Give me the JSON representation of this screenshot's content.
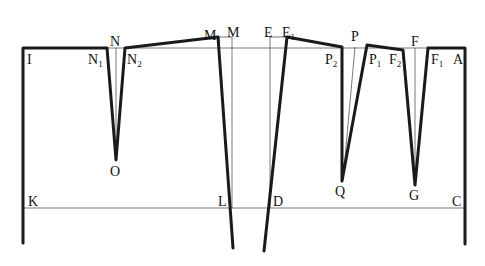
{
  "diagram": {
    "type": "pattern-draft",
    "labels": [
      {
        "id": "I",
        "text": "I",
        "x": 27,
        "y": 64
      },
      {
        "id": "N1",
        "text": "N",
        "sub": "1",
        "x": 90,
        "y": 64
      },
      {
        "id": "N",
        "text": "N",
        "x": 110,
        "y": 46
      },
      {
        "id": "N2",
        "text": "N",
        "sub": "2",
        "x": 128,
        "y": 64
      },
      {
        "id": "O",
        "text": "O",
        "x": 111,
        "y": 176
      },
      {
        "id": "M1",
        "text": "M",
        "sub": "1",
        "x": 204,
        "y": 40
      },
      {
        "id": "M",
        "text": "M",
        "x": 228,
        "y": 40
      },
      {
        "id": "E",
        "text": "E",
        "x": 264,
        "y": 40
      },
      {
        "id": "E1",
        "text": "E",
        "sub": "1",
        "x": 282,
        "y": 40
      },
      {
        "id": "P",
        "text": "P",
        "x": 351,
        "y": 42
      },
      {
        "id": "P2",
        "text": "P",
        "sub": "2",
        "x": 326,
        "y": 64
      },
      {
        "id": "P1",
        "text": "P",
        "sub": "1",
        "x": 369,
        "y": 64
      },
      {
        "id": "F",
        "text": "F",
        "x": 411,
        "y": 46
      },
      {
        "id": "F2",
        "text": "F",
        "sub": "2",
        "x": 389,
        "y": 64
      },
      {
        "id": "F1",
        "text": "F",
        "sub": "1",
        "x": 431,
        "y": 64
      },
      {
        "id": "A",
        "text": "A",
        "x": 453,
        "y": 64
      },
      {
        "id": "Q",
        "text": "Q",
        "x": 337,
        "y": 196
      },
      {
        "id": "G",
        "text": "G",
        "x": 409,
        "y": 200
      },
      {
        "id": "K",
        "text": "K",
        "x": 28,
        "y": 207
      },
      {
        "id": "L",
        "text": "L",
        "x": 218,
        "y": 207
      },
      {
        "id": "D",
        "text": "D",
        "x": 273,
        "y": 207
      },
      {
        "id": "C",
        "text": "C",
        "x": 453,
        "y": 207
      }
    ]
  }
}
